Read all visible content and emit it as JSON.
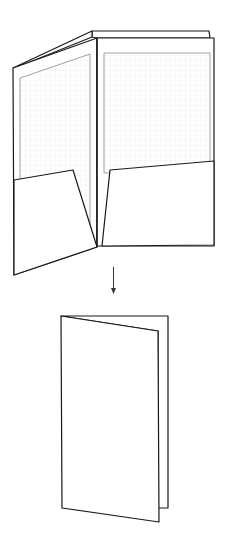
{
  "diagram": {
    "colors": {
      "stroke": "#1a1a1a",
      "paper": "#ffffff",
      "insert_fill": "#f4f4f4",
      "insert_stroke": "#888888",
      "grid": "#e8e8e8"
    },
    "stages": [
      {
        "name": "open-folder",
        "parts": [
          "left-panel",
          "right-panel",
          "back-sheet",
          "left-insert",
          "right-insert",
          "left-pocket",
          "right-pocket"
        ]
      },
      {
        "name": "arrow",
        "direction": "down"
      },
      {
        "name": "closed-folder",
        "parts": [
          "back-cover",
          "front-cover"
        ]
      }
    ]
  }
}
